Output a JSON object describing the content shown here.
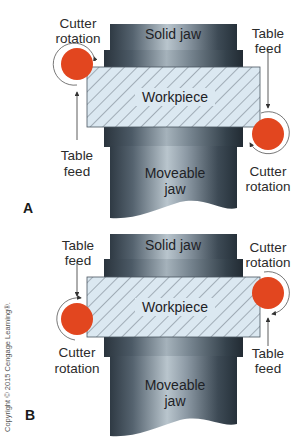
{
  "colors": {
    "jaw_dark": "#3a4550",
    "jaw_light": "#c9d3da",
    "workpiece_fill": "#dbe8f1",
    "hatch": "#4a5560",
    "cutter": "#e2461f",
    "arrow": "#333333"
  },
  "panels": [
    {
      "id": "A",
      "label": "A",
      "solid_jaw": "Solid jaw",
      "workpiece": "Workpiece",
      "moveable_jaw_line1": "Moveable",
      "moveable_jaw_line2": "jaw",
      "left_top_line1": "Cutter",
      "left_top_line2": "rotation",
      "left_bottom_line1": "Table",
      "left_bottom_line2": "feed",
      "right_top_line1": "Table",
      "right_top_line2": "feed",
      "right_bottom_line1": "Cutter",
      "right_bottom_line2": "rotation"
    },
    {
      "id": "B",
      "label": "B",
      "solid_jaw": "Solid jaw",
      "workpiece": "Workpiece",
      "moveable_jaw_line1": "Moveable",
      "moveable_jaw_line2": "jaw",
      "left_top_line1": "Table",
      "left_top_line2": "feed",
      "left_bottom_line1": "Cutter",
      "left_bottom_line2": "rotation",
      "right_top_line1": "Cutter",
      "right_top_line2": "rotation",
      "right_bottom_line1": "Table",
      "right_bottom_line2": "feed"
    }
  ],
  "copyright": "Copyright © 2015 Cengage Learning®."
}
